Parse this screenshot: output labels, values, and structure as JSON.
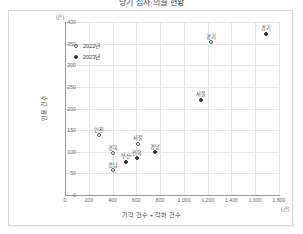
{
  "title": "당기 심사·의결 현황",
  "legend": {
    "position": "top-left",
    "items": [
      {
        "label": "2022년",
        "marker": "hollow-circle",
        "series": "y2022"
      },
      {
        "label": "2023년",
        "marker": "filled-circle",
        "series": "y2023"
      }
    ]
  },
  "axes": {
    "x": {
      "title": "기각 건수 + 각하 건수",
      "unit": "(건)",
      "min": 0,
      "max": 1800,
      "ticks": [
        "0",
        "200",
        "400",
        "600",
        "800",
        "1,000",
        "1,200",
        "1,400",
        "1,600",
        "1,800"
      ]
    },
    "y": {
      "title": "인용 건수",
      "unit": "(건)",
      "min": 0,
      "max": 400,
      "ticks": [
        "0",
        "50",
        "100",
        "150",
        "200",
        "250",
        "300",
        "350",
        "400"
      ]
    }
  },
  "chart_data": {
    "type": "scatter",
    "title": "당기 심사·의결 현황",
    "xlabel": "기각 건수 + 각하 건수",
    "ylabel": "인용 건수",
    "xlim": [
      0,
      1800
    ],
    "ylim": [
      0,
      400
    ],
    "grid": true,
    "legend_position": "top-left",
    "series": [
      {
        "name": "2022년",
        "marker": "hollow-circle",
        "points": [
          {
            "label": "경기",
            "x": 1230,
            "y": 353
          },
          {
            "label": "인천",
            "x": 290,
            "y": 138
          },
          {
            "label": "경북",
            "x": 400,
            "y": 96
          },
          {
            "label": "서울",
            "x": 610,
            "y": 118
          },
          {
            "label": "경남",
            "x": 405,
            "y": 57
          }
        ]
      },
      {
        "name": "2023년",
        "marker": "filled-circle",
        "points": [
          {
            "label": "경기",
            "x": 1690,
            "y": 373
          },
          {
            "label": "서울",
            "x": 1145,
            "y": 220
          },
          {
            "label": "부산",
            "x": 510,
            "y": 77
          },
          {
            "label": "전북",
            "x": 605,
            "y": 85
          },
          {
            "label": "경남",
            "x": 755,
            "y": 99
          }
        ]
      }
    ]
  }
}
